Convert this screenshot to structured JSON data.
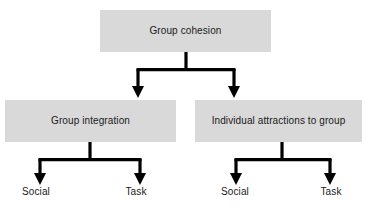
{
  "diagram": {
    "type": "hierarchy-tree",
    "title": "Group cohesion",
    "background_color": "#ffffff",
    "box_fill_color": "#d9d9d9",
    "line_color": "#000000",
    "text_color": "#1a1a1a",
    "nodes": {
      "root": {
        "label": "Group cohesion"
      },
      "level2": [
        {
          "label": "Group integration"
        },
        {
          "label": "Individual attractions to group"
        }
      ],
      "level3": [
        {
          "label": "Social"
        },
        {
          "label": "Task"
        },
        {
          "label": "Social"
        },
        {
          "label": "Task"
        }
      ]
    }
  }
}
